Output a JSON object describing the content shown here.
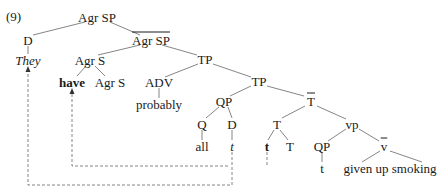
{
  "example_number": "(9)",
  "nodes": {
    "root": "Agr SP",
    "d1": "D",
    "they": "They",
    "agrsp_bar": "Agr SP",
    "agrs": "Agr S",
    "have": "have",
    "agrs2": "Agr S",
    "tp1": "TP",
    "adv": "ADV",
    "probably": "probably",
    "tp2": "TP",
    "qp1": "QP",
    "q": "Q",
    "all": "all",
    "d2": "D",
    "t_d": "t",
    "tbar": "T",
    "t_node": "T",
    "t_bold": "t",
    "t_head": "T",
    "vp": "vp",
    "qp2": "QP",
    "t_qp": "t",
    "vbar": "v",
    "vp_leaf": "given up smoking"
  },
  "annotations": {
    "bar_nodes": [
      "Agr SP (second)",
      "T (T-bar)",
      "v (v-bar)"
    ],
    "movement_arrows": [
      {
        "from": "t (under D in QP)",
        "to": "They",
        "style": "dashed"
      },
      {
        "from": "t (under D in QP)",
        "to": "have",
        "style": "dashed"
      }
    ]
  }
}
